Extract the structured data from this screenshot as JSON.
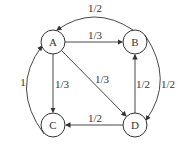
{
  "diagram": {
    "type": "directed-graph",
    "nodes": [
      {
        "id": "A",
        "label": "A",
        "x": 53,
        "y": 42
      },
      {
        "id": "B",
        "label": "B",
        "x": 135,
        "y": 42
      },
      {
        "id": "C",
        "label": "C",
        "x": 53,
        "y": 125
      },
      {
        "id": "D",
        "label": "D",
        "x": 135,
        "y": 125
      }
    ],
    "edges": [
      {
        "from": "A",
        "to": "B",
        "label": "1/3"
      },
      {
        "from": "A",
        "to": "C",
        "label": "1/3"
      },
      {
        "from": "A",
        "to": "D",
        "label": "1/3"
      },
      {
        "from": "B",
        "to": "A",
        "label": "1/2"
      },
      {
        "from": "B",
        "to": "D",
        "label": "1/2"
      },
      {
        "from": "C",
        "to": "A",
        "label": "1"
      },
      {
        "from": "D",
        "to": "B",
        "label": "1/2"
      },
      {
        "from": "D",
        "to": "C",
        "label": "1/2"
      }
    ]
  }
}
